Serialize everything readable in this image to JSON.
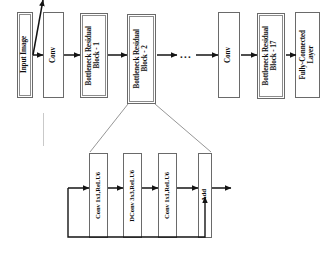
{
  "figure": {
    "type": "neural-network-architecture-diagram"
  },
  "main_pipeline": {
    "name": "backbone-pipeline",
    "blocks": [
      {
        "id": "input-image",
        "label": "Input Image",
        "x": 17,
        "y": 12,
        "w": 16,
        "h": 86,
        "double_border": true
      },
      {
        "id": "conv-1",
        "label": "Conv",
        "x": 43,
        "y": 12,
        "w": 21,
        "h": 86,
        "double_border": false
      },
      {
        "id": "bottleneck-1",
        "label": "Bottleneck Residual\nBlock - 1",
        "x": 80,
        "y": 13,
        "w": 28,
        "h": 85,
        "double_border": true
      },
      {
        "id": "bottleneck-2",
        "label": "Bottleneck Residual\nBlock - 2",
        "x": 127,
        "y": 14,
        "w": 29,
        "h": 90,
        "double_border": true
      },
      {
        "id": "conv-2",
        "label": "Conv",
        "x": 218,
        "y": 12,
        "w": 22,
        "h": 86,
        "double_border": false
      },
      {
        "id": "bottleneck-17",
        "label": "Bottleneck Residual\nBlock - 17",
        "x": 257,
        "y": 13,
        "w": 28,
        "h": 86,
        "double_border": true
      },
      {
        "id": "fully-connected",
        "label": "Fully-Connected\nLayer",
        "x": 295,
        "y": 12,
        "w": 25,
        "h": 86,
        "double_border": false
      }
    ],
    "ellipsis": {
      "id": "pipeline-ellipsis",
      "label": "...",
      "x": 180,
      "y": 49
    },
    "arrows": [
      {
        "from": "input-image",
        "to": "conv-1",
        "x1": 33,
        "x2": 43,
        "y": 55
      },
      {
        "from": "conv-1",
        "to": "bottleneck-1",
        "x1": 64,
        "x2": 80,
        "y": 55
      },
      {
        "from": "bottleneck-1",
        "to": "bottleneck-2",
        "x1": 108,
        "x2": 127,
        "y": 55
      },
      {
        "from": "bottleneck-2",
        "to": "ellipsis",
        "x1": 156,
        "x2": 178,
        "y": 55
      },
      {
        "from": "ellipsis",
        "to": "conv-2",
        "x1": 196,
        "x2": 218,
        "y": 55
      },
      {
        "from": "conv-2",
        "to": "bottleneck-17",
        "x1": 240,
        "x2": 257,
        "y": 55
      },
      {
        "from": "bottleneck-17",
        "to": "fully-connected",
        "x1": 285,
        "x2": 295,
        "y": 55
      }
    ]
  },
  "expanded_block": {
    "name": "bottleneck-residual-block-detail",
    "expands_from": "bottleneck-2",
    "blocks": [
      {
        "id": "conv-1x1-relu6-a",
        "label": "Conv 1x1,ReLU6",
        "x": 89,
        "y": 153,
        "w": 19,
        "h": 85
      },
      {
        "id": "dconv-3x3-relu6",
        "label": "DConv 3x3,ReLU6",
        "x": 123,
        "y": 153,
        "w": 19,
        "h": 85
      },
      {
        "id": "conv-1x1-relu6-b",
        "label": "Conv 1x1,ReLU6",
        "x": 158,
        "y": 153,
        "w": 19,
        "h": 85
      },
      {
        "id": "add",
        "label": "Add",
        "x": 198,
        "y": 153,
        "w": 14,
        "h": 85
      }
    ],
    "arrows": [
      {
        "from": "block-input",
        "to": "conv-1x1-relu6-a",
        "x1": 68,
        "x2": 89,
        "y": 188
      },
      {
        "from": "conv-1x1-relu6-a",
        "to": "dconv-3x3-relu6",
        "x1": 108,
        "x2": 123,
        "y": 188
      },
      {
        "from": "dconv-3x3-relu6",
        "to": "conv-1x1-relu6-b",
        "x1": 142,
        "x2": 158,
        "y": 188
      },
      {
        "from": "conv-1x1-relu6-b",
        "to": "add",
        "x1": 177,
        "x2": 198,
        "y": 188
      },
      {
        "from": "add",
        "to": "block-output",
        "x1": 212,
        "x2": 231,
        "y": 188
      }
    ],
    "skip_connection": {
      "id": "residual-skip-connection",
      "path": "M 68 188 L 68 237 L 205 237 L 205 196"
    },
    "expansion_guides": [
      {
        "id": "expansion-guide-left",
        "x1": 128,
        "y1": 104,
        "x2": 89,
        "y2": 152
      },
      {
        "id": "expansion-guide-right",
        "x1": 155,
        "y1": 104,
        "x2": 212,
        "y2": 152
      }
    ]
  },
  "colors": {
    "background": "#ffffff",
    "box_border": "#6a6a6a",
    "line": "#1a1a1a",
    "text": "#0d0d0d",
    "faint_artifact": "#c9c9c9"
  }
}
